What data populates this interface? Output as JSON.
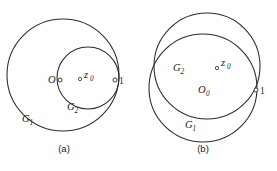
{
  "figure": {
    "background_color": "#fefefe",
    "stroke_color": "#2b2b2b",
    "panels": [
      {
        "id": "panel-a",
        "caption": "(a)",
        "caption_x": 64,
        "caption_y": 152,
        "description": "Two internally tangent circles: large circle G1 and smaller circle G2 tangent at the point labelled 1",
        "circles": [
          {
            "name": "G1",
            "cx": 63,
            "cy": 75,
            "r": 56
          },
          {
            "name": "G2",
            "cx": 88,
            "cy": 78,
            "r": 31
          }
        ],
        "points": [
          {
            "label": "O",
            "sub": "",
            "marker_x": 60,
            "marker_y": 80,
            "text_x": 48,
            "text_y": 83,
            "marker_r": 2.0
          },
          {
            "label": "z",
            "sub": "0",
            "marker_x": 80,
            "marker_y": 79,
            "text_x": 84,
            "text_y": 78,
            "marker_r": 1.7
          },
          {
            "label": "1",
            "sub": "",
            "marker_x": 115,
            "marker_y": 80,
            "text_x": 119,
            "text_y": 84,
            "marker_r": 2.0
          }
        ],
        "curve_labels": [
          {
            "text": "G",
            "sub": "1",
            "x": 22,
            "y": 122
          },
          {
            "text": "G",
            "sub": "2",
            "x": 67,
            "y": 110
          }
        ]
      },
      {
        "id": "panel-b",
        "caption": "(b)",
        "caption_x": 203,
        "caption_y": 152,
        "description": "Two intersecting circles G1 and G2 of similar size crossing at the point labelled 1 and a left intersection point",
        "circles": [
          {
            "name": "G2",
            "cx": 207,
            "cy": 66,
            "r": 53
          },
          {
            "name": "G1",
            "cx": 203,
            "cy": 88,
            "r": 54
          }
        ],
        "points": [
          {
            "label": "z",
            "sub": "0",
            "marker_x": 217,
            "marker_y": 68,
            "text_x": 221,
            "text_y": 66,
            "marker_r": 1.7
          },
          {
            "label": "O",
            "sub": "0",
            "marker_x": 0,
            "marker_y": 0,
            "text_x": 198,
            "text_y": 93,
            "marker_r": 0
          },
          {
            "label": "1",
            "sub": "",
            "marker_x": 256,
            "marker_y": 90,
            "text_x": 260,
            "text_y": 94,
            "marker_r": 2.0
          }
        ],
        "curve_labels": [
          {
            "text": "G",
            "sub": "2",
            "x": 173,
            "y": 71
          },
          {
            "text": "G",
            "sub": "1",
            "x": 185,
            "y": 128
          }
        ]
      }
    ]
  }
}
